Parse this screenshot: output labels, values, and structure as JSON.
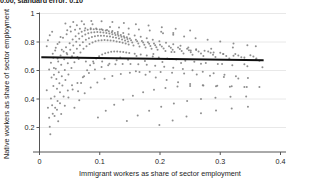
{
  "caption": {
    "text": "0.00, standard error: 0.10"
  },
  "chart_data": {
    "type": "scatter",
    "title": "",
    "xlabel": "Immigrant workers as share of sector employment",
    "ylabel": "Native workers as share of sector employment",
    "xlim": [
      0,
      0.4
    ],
    "ylim": [
      0.1,
      1.0
    ],
    "xticks": [
      0,
      0.1,
      0.2,
      0.3,
      0.4
    ],
    "xtick_labels": [
      "0",
      "0.1",
      "0.2",
      "0.3",
      "0.4"
    ],
    "yticks": [
      0.2,
      0.4,
      0.6,
      0.8,
      1
    ],
    "ytick_labels": [
      "0.2",
      "0.4",
      "0.6",
      "0.8",
      "1"
    ],
    "grid": "horizontal",
    "legend": "none",
    "marker_color": "#7f7f7f",
    "marker_size": 2,
    "fit_line": {
      "label": "linear fit",
      "color": "#111111",
      "width": 2,
      "x_start": 0.003,
      "x_end": 0.372,
      "y_start": 0.693,
      "y_end": 0.672,
      "slope": -0.057,
      "intercept": 0.693
    },
    "points": [
      [
        0.012,
        0.462
      ],
      [
        0.014,
        0.338
      ],
      [
        0.016,
        0.268
      ],
      [
        0.017,
        0.205
      ],
      [
        0.018,
        0.152
      ],
      [
        0.019,
        0.404
      ],
      [
        0.021,
        0.357
      ],
      [
        0.022,
        0.296
      ],
      [
        0.023,
        0.492
      ],
      [
        0.024,
        0.571
      ],
      [
        0.025,
        0.418
      ],
      [
        0.026,
        0.338
      ],
      [
        0.027,
        0.612
      ],
      [
        0.028,
        0.54
      ],
      [
        0.029,
        0.472
      ],
      [
        0.03,
        0.386
      ],
      [
        0.031,
        0.663
      ],
      [
        0.032,
        0.588
      ],
      [
        0.033,
        0.511
      ],
      [
        0.034,
        0.447
      ],
      [
        0.035,
        0.706
      ],
      [
        0.036,
        0.64
      ],
      [
        0.037,
        0.56
      ],
      [
        0.038,
        0.495
      ],
      [
        0.04,
        0.733
      ],
      [
        0.041,
        0.679
      ],
      [
        0.042,
        0.604
      ],
      [
        0.043,
        0.533
      ],
      [
        0.044,
        0.763
      ],
      [
        0.046,
        0.714
      ],
      [
        0.047,
        0.651
      ],
      [
        0.048,
        0.572
      ],
      [
        0.05,
        0.792
      ],
      [
        0.051,
        0.746
      ],
      [
        0.052,
        0.69
      ],
      [
        0.053,
        0.618
      ],
      [
        0.055,
        0.818
      ],
      [
        0.056,
        0.775
      ],
      [
        0.057,
        0.722
      ],
      [
        0.058,
        0.658
      ],
      [
        0.06,
        0.841
      ],
      [
        0.061,
        0.801
      ],
      [
        0.062,
        0.752
      ],
      [
        0.063,
        0.694
      ],
      [
        0.064,
        0.455
      ],
      [
        0.065,
        0.86
      ],
      [
        0.066,
        0.823
      ],
      [
        0.067,
        0.778
      ],
      [
        0.068,
        0.726
      ],
      [
        0.069,
        0.512
      ],
      [
        0.07,
        0.872
      ],
      [
        0.071,
        0.84
      ],
      [
        0.072,
        0.799
      ],
      [
        0.073,
        0.752
      ],
      [
        0.074,
        0.56
      ],
      [
        0.075,
        0.881
      ],
      [
        0.076,
        0.852
      ],
      [
        0.077,
        0.815
      ],
      [
        0.078,
        0.771
      ],
      [
        0.079,
        0.601
      ],
      [
        0.08,
        0.886
      ],
      [
        0.081,
        0.861
      ],
      [
        0.082,
        0.827
      ],
      [
        0.083,
        0.786
      ],
      [
        0.084,
        0.636
      ],
      [
        0.085,
        0.889
      ],
      [
        0.086,
        0.866
      ],
      [
        0.087,
        0.835
      ],
      [
        0.088,
        0.797
      ],
      [
        0.089,
        0.663
      ],
      [
        0.09,
        0.89
      ],
      [
        0.091,
        0.869
      ],
      [
        0.092,
        0.84
      ],
      [
        0.093,
        0.805
      ],
      [
        0.094,
        0.684
      ],
      [
        0.095,
        0.889
      ],
      [
        0.096,
        0.87
      ],
      [
        0.097,
        0.843
      ],
      [
        0.098,
        0.81
      ],
      [
        0.099,
        0.7
      ],
      [
        0.1,
        0.887
      ],
      [
        0.101,
        0.869
      ],
      [
        0.102,
        0.844
      ],
      [
        0.103,
        0.813
      ],
      [
        0.104,
        0.712
      ],
      [
        0.105,
        0.884
      ],
      [
        0.106,
        0.867
      ],
      [
        0.107,
        0.843
      ],
      [
        0.108,
        0.814
      ],
      [
        0.109,
        0.721
      ],
      [
        0.11,
        0.88
      ],
      [
        0.111,
        0.864
      ],
      [
        0.112,
        0.841
      ],
      [
        0.113,
        0.813
      ],
      [
        0.114,
        0.727
      ],
      [
        0.115,
        0.875
      ],
      [
        0.116,
        0.86
      ],
      [
        0.117,
        0.838
      ],
      [
        0.118,
        0.811
      ],
      [
        0.119,
        0.731
      ],
      [
        0.12,
        0.869
      ],
      [
        0.121,
        0.855
      ],
      [
        0.122,
        0.834
      ],
      [
        0.123,
        0.808
      ],
      [
        0.124,
        0.733
      ],
      [
        0.125,
        0.863
      ],
      [
        0.126,
        0.849
      ],
      [
        0.127,
        0.829
      ],
      [
        0.128,
        0.804
      ],
      [
        0.129,
        0.733
      ],
      [
        0.13,
        0.856
      ],
      [
        0.131,
        0.843
      ],
      [
        0.132,
        0.824
      ],
      [
        0.133,
        0.8
      ],
      [
        0.134,
        0.732
      ],
      [
        0.135,
        0.849
      ],
      [
        0.136,
        0.836
      ],
      [
        0.137,
        0.818
      ],
      [
        0.138,
        0.795
      ],
      [
        0.139,
        0.73
      ],
      [
        0.14,
        0.841
      ],
      [
        0.141,
        0.829
      ],
      [
        0.142,
        0.811
      ],
      [
        0.143,
        0.789
      ],
      [
        0.144,
        0.727
      ],
      [
        0.145,
        0.833
      ],
      [
        0.146,
        0.821
      ],
      [
        0.147,
        0.804
      ],
      [
        0.148,
        0.783
      ],
      [
        0.149,
        0.723
      ],
      [
        0.15,
        0.825
      ],
      [
        0.152,
        0.813
      ],
      [
        0.154,
        0.797
      ],
      [
        0.156,
        0.776
      ],
      [
        0.158,
        0.718
      ],
      [
        0.16,
        0.816
      ],
      [
        0.162,
        0.805
      ],
      [
        0.164,
        0.789
      ],
      [
        0.166,
        0.769
      ],
      [
        0.168,
        0.712
      ],
      [
        0.17,
        0.807
      ],
      [
        0.172,
        0.796
      ],
      [
        0.174,
        0.781
      ],
      [
        0.176,
        0.761
      ],
      [
        0.178,
        0.706
      ],
      [
        0.18,
        0.798
      ],
      [
        0.182,
        0.787
      ],
      [
        0.184,
        0.772
      ],
      [
        0.186,
        0.753
      ],
      [
        0.188,
        0.699
      ],
      [
        0.19,
        0.789
      ],
      [
        0.192,
        0.778
      ],
      [
        0.194,
        0.764
      ],
      [
        0.196,
        0.745
      ],
      [
        0.198,
        0.692
      ],
      [
        0.2,
        0.78
      ],
      [
        0.203,
        0.769
      ],
      [
        0.206,
        0.755
      ],
      [
        0.209,
        0.737
      ],
      [
        0.212,
        0.685
      ],
      [
        0.215,
        0.771
      ],
      [
        0.218,
        0.76
      ],
      [
        0.221,
        0.746
      ],
      [
        0.224,
        0.729
      ],
      [
        0.227,
        0.677
      ],
      [
        0.23,
        0.761
      ],
      [
        0.233,
        0.751
      ],
      [
        0.236,
        0.737
      ],
      [
        0.239,
        0.72
      ],
      [
        0.242,
        0.669
      ],
      [
        0.245,
        0.752
      ],
      [
        0.248,
        0.742
      ],
      [
        0.251,
        0.728
      ],
      [
        0.254,
        0.711
      ],
      [
        0.257,
        0.661
      ],
      [
        0.26,
        0.743
      ],
      [
        0.264,
        0.733
      ],
      [
        0.268,
        0.719
      ],
      [
        0.272,
        0.702
      ],
      [
        0.276,
        0.653
      ],
      [
        0.28,
        0.734
      ],
      [
        0.284,
        0.724
      ],
      [
        0.288,
        0.71
      ],
      [
        0.292,
        0.694
      ],
      [
        0.296,
        0.645
      ],
      [
        0.3,
        0.725
      ],
      [
        0.305,
        0.715
      ],
      [
        0.31,
        0.701
      ],
      [
        0.315,
        0.685
      ],
      [
        0.32,
        0.637
      ],
      [
        0.325,
        0.716
      ],
      [
        0.33,
        0.706
      ],
      [
        0.335,
        0.693
      ],
      [
        0.34,
        0.677
      ],
      [
        0.345,
        0.629
      ],
      [
        0.35,
        0.707
      ],
      [
        0.355,
        0.698
      ],
      [
        0.36,
        0.685
      ],
      [
        0.365,
        0.669
      ],
      [
        0.37,
        0.622
      ],
      [
        0.022,
        0.718
      ],
      [
        0.027,
        0.76
      ],
      [
        0.033,
        0.798
      ],
      [
        0.039,
        0.829
      ],
      [
        0.045,
        0.855
      ],
      [
        0.052,
        0.874
      ],
      [
        0.059,
        0.886
      ],
      [
        0.067,
        0.893
      ],
      [
        0.076,
        0.896
      ],
      [
        0.085,
        0.896
      ],
      [
        0.094,
        0.894
      ],
      [
        0.103,
        0.89
      ],
      [
        0.112,
        0.885
      ],
      [
        0.121,
        0.878
      ],
      [
        0.13,
        0.871
      ],
      [
        0.139,
        0.863
      ],
      [
        0.148,
        0.855
      ],
      [
        0.158,
        0.846
      ],
      [
        0.168,
        0.836
      ],
      [
        0.178,
        0.826
      ],
      [
        0.188,
        0.816
      ],
      [
        0.199,
        0.806
      ],
      [
        0.21,
        0.795
      ],
      [
        0.222,
        0.784
      ],
      [
        0.234,
        0.773
      ],
      [
        0.247,
        0.762
      ],
      [
        0.26,
        0.75
      ],
      [
        0.274,
        0.739
      ],
      [
        0.289,
        0.727
      ],
      [
        0.305,
        0.715
      ],
      [
        0.322,
        0.703
      ],
      [
        0.34,
        0.691
      ],
      [
        0.359,
        0.678
      ],
      [
        0.031,
        0.243
      ],
      [
        0.036,
        0.294
      ],
      [
        0.042,
        0.352
      ],
      [
        0.048,
        0.411
      ],
      [
        0.055,
        0.466
      ],
      [
        0.063,
        0.513
      ],
      [
        0.072,
        0.552
      ],
      [
        0.082,
        0.583
      ],
      [
        0.092,
        0.607
      ],
      [
        0.103,
        0.624
      ],
      [
        0.114,
        0.636
      ],
      [
        0.126,
        0.643
      ],
      [
        0.138,
        0.646
      ],
      [
        0.151,
        0.646
      ],
      [
        0.164,
        0.644
      ],
      [
        0.178,
        0.64
      ],
      [
        0.192,
        0.634
      ],
      [
        0.207,
        0.627
      ],
      [
        0.222,
        0.619
      ],
      [
        0.238,
        0.61
      ],
      [
        0.254,
        0.601
      ],
      [
        0.271,
        0.591
      ],
      [
        0.289,
        0.581
      ],
      [
        0.307,
        0.57
      ],
      [
        0.326,
        0.559
      ],
      [
        0.346,
        0.548
      ],
      [
        0.058,
        0.338
      ],
      [
        0.066,
        0.392
      ],
      [
        0.075,
        0.44
      ],
      [
        0.085,
        0.481
      ],
      [
        0.096,
        0.515
      ],
      [
        0.108,
        0.542
      ],
      [
        0.121,
        0.562
      ],
      [
        0.135,
        0.576
      ],
      [
        0.15,
        0.585
      ],
      [
        0.166,
        0.59
      ],
      [
        0.183,
        0.591
      ],
      [
        0.201,
        0.589
      ],
      [
        0.22,
        0.585
      ],
      [
        0.24,
        0.579
      ],
      [
        0.261,
        0.572
      ],
      [
        0.283,
        0.563
      ],
      [
        0.306,
        0.554
      ],
      [
        0.33,
        0.544
      ],
      [
        0.097,
        0.271
      ],
      [
        0.11,
        0.318
      ],
      [
        0.124,
        0.359
      ],
      [
        0.139,
        0.394
      ],
      [
        0.155,
        0.423
      ],
      [
        0.172,
        0.447
      ],
      [
        0.19,
        0.465
      ],
      [
        0.209,
        0.478
      ],
      [
        0.229,
        0.487
      ],
      [
        0.25,
        0.492
      ],
      [
        0.272,
        0.494
      ],
      [
        0.295,
        0.493
      ],
      [
        0.319,
        0.49
      ],
      [
        0.344,
        0.485
      ],
      [
        0.145,
        0.246
      ],
      [
        0.163,
        0.284
      ],
      [
        0.182,
        0.317
      ],
      [
        0.202,
        0.345
      ],
      [
        0.223,
        0.368
      ],
      [
        0.245,
        0.386
      ],
      [
        0.268,
        0.4
      ],
      [
        0.292,
        0.409
      ],
      [
        0.317,
        0.415
      ],
      [
        0.343,
        0.418
      ],
      [
        0.199,
        0.217
      ],
      [
        0.221,
        0.249
      ],
      [
        0.244,
        0.277
      ],
      [
        0.268,
        0.3
      ],
      [
        0.293,
        0.319
      ],
      [
        0.319,
        0.334
      ],
      [
        0.346,
        0.345
      ],
      [
        0.043,
        0.93
      ],
      [
        0.056,
        0.941
      ],
      [
        0.07,
        0.946
      ],
      [
        0.086,
        0.948
      ],
      [
        0.103,
        0.946
      ],
      [
        0.121,
        0.941
      ],
      [
        0.14,
        0.934
      ],
      [
        0.16,
        0.925
      ],
      [
        0.181,
        0.915
      ],
      [
        0.203,
        0.904
      ],
      [
        0.226,
        0.893
      ],
      [
        0.25,
        0.881
      ],
      [
        0.016,
        0.607
      ],
      [
        0.019,
        0.655
      ],
      [
        0.023,
        0.69
      ],
      [
        0.026,
        0.74
      ],
      [
        0.03,
        0.786
      ],
      [
        0.035,
        0.835
      ],
      [
        0.046,
        0.883
      ],
      [
        0.051,
        0.907
      ],
      [
        0.062,
        0.918
      ],
      [
        0.074,
        0.924
      ],
      [
        0.088,
        0.925
      ],
      [
        0.134,
        0.692
      ],
      [
        0.147,
        0.676
      ],
      [
        0.161,
        0.701
      ],
      [
        0.175,
        0.666
      ],
      [
        0.189,
        0.716
      ],
      [
        0.204,
        0.659
      ],
      [
        0.219,
        0.729
      ],
      [
        0.235,
        0.652
      ],
      [
        0.251,
        0.741
      ],
      [
        0.268,
        0.648
      ],
      [
        0.285,
        0.752
      ],
      [
        0.303,
        0.645
      ],
      [
        0.321,
        0.762
      ],
      [
        0.34,
        0.643
      ],
      [
        0.359,
        0.771
      ],
      [
        0.104,
        0.663
      ],
      [
        0.116,
        0.648
      ],
      [
        0.128,
        0.672
      ],
      [
        0.09,
        0.651
      ],
      [
        0.077,
        0.663
      ],
      [
        0.065,
        0.681
      ],
      [
        0.054,
        0.7
      ],
      [
        0.045,
        0.722
      ],
      [
        0.037,
        0.745
      ],
      [
        0.03,
        0.684
      ],
      [
        0.024,
        0.618
      ],
      [
        0.02,
        0.551
      ],
      [
        0.16,
        0.594
      ],
      [
        0.176,
        0.571
      ],
      [
        0.193,
        0.551
      ],
      [
        0.211,
        0.533
      ],
      [
        0.23,
        0.518
      ],
      [
        0.25,
        0.506
      ],
      [
        0.271,
        0.497
      ],
      [
        0.293,
        0.49
      ],
      [
        0.316,
        0.486
      ],
      [
        0.34,
        0.484
      ],
      [
        0.365,
        0.484
      ],
      [
        0.012,
        0.77
      ],
      [
        0.014,
        0.812
      ],
      [
        0.017,
        0.847
      ],
      [
        0.021,
        0.872
      ],
      [
        0.025,
        0.281
      ],
      [
        0.029,
        0.325
      ],
      [
        0.034,
        0.371
      ],
      [
        0.04,
        0.417
      ],
      [
        0.047,
        0.459
      ],
      [
        0.054,
        0.497
      ],
      [
        0.205,
        0.862
      ],
      [
        0.222,
        0.851
      ],
      [
        0.24,
        0.839
      ],
      [
        0.259,
        0.827
      ],
      [
        0.279,
        0.815
      ],
      [
        0.3,
        0.803
      ],
      [
        0.322,
        0.79
      ],
      [
        0.345,
        0.778
      ],
      [
        0.117,
        0.906
      ],
      [
        0.132,
        0.901
      ],
      [
        0.148,
        0.895
      ],
      [
        0.165,
        0.888
      ],
      [
        0.183,
        0.88
      ],
      [
        0.202,
        0.872
      ],
      [
        0.222,
        0.864
      ]
    ]
  }
}
